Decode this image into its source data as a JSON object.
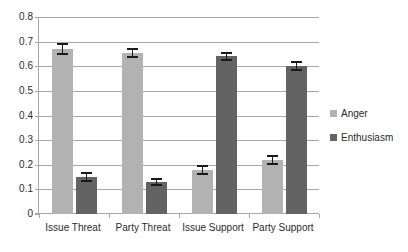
{
  "chart_data": {
    "type": "bar",
    "title": "",
    "xlabel": "",
    "ylabel": "",
    "categories": [
      "Issue Threat",
      "Party Threat",
      "Issue Support",
      "Party Support"
    ],
    "series": [
      {
        "name": "Anger",
        "color": "#b2b2b2",
        "values": [
          0.67,
          0.655,
          0.18,
          0.22
        ],
        "errors": [
          0.025,
          0.02,
          0.02,
          0.02
        ]
      },
      {
        "name": "Enthusiasm",
        "color": "#636363",
        "values": [
          0.15,
          0.13,
          0.64,
          0.6
        ],
        "errors": [
          0.02,
          0.018,
          0.018,
          0.02
        ]
      }
    ],
    "ylim": [
      0,
      0.8
    ],
    "yticks": [
      0,
      0.1,
      0.2,
      0.3,
      0.4,
      0.5,
      0.6,
      0.7,
      0.8
    ],
    "ytick_labels": [
      "0",
      "0.1",
      "0.2",
      "0.3",
      "0.4",
      "0.5",
      "0.6",
      "0.7",
      "0.8"
    ],
    "grid": true,
    "legend_position": "right",
    "error_bars": true
  },
  "legend": {
    "items": [
      {
        "label": "Anger",
        "color": "#b2b2b2"
      },
      {
        "label": "Enthusiasm",
        "color": "#636363"
      }
    ]
  }
}
